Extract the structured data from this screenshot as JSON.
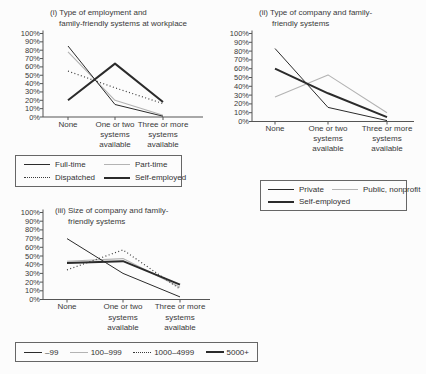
{
  "figure": {
    "background": "#fcfcfc",
    "text_color": "#333333",
    "axis_color": "#555555",
    "line_black": "#2b2b2b",
    "line_gray": "#b3b3b3"
  },
  "chart_data": [
    {
      "type": "line",
      "title_lines": [
        "(i) Type of employment and",
        "family-friendly systems at workplace"
      ],
      "categories": [
        "None",
        "One or two systems available",
        "Three or more systems available"
      ],
      "category_label_lines": [
        [
          "None"
        ],
        [
          "One or two",
          "systems",
          "available"
        ],
        [
          "Three or more",
          "systems",
          "available"
        ]
      ],
      "y_ticks": [
        "100%",
        "90%",
        "80%",
        "70%",
        "60%",
        "50%",
        "40%",
        "30%",
        "20%",
        "10%",
        "0%"
      ],
      "ylim": [
        0,
        100
      ],
      "grid": false,
      "series": [
        {
          "name": "Part-time",
          "values": [
            78,
            20,
            2
          ],
          "color": "#b3b3b3",
          "width": 1.1,
          "dash": ""
        },
        {
          "name": "Dispatched",
          "values": [
            55,
            35,
            16
          ],
          "color": "#3a3a3a",
          "width": 1.2,
          "dash": "1,2.4"
        },
        {
          "name": "Full-time",
          "values": [
            85,
            15,
            1
          ],
          "color": "#2b2b2b",
          "width": 1,
          "dash": ""
        },
        {
          "name": "Self-employed",
          "values": [
            20,
            64,
            18
          ],
          "color": "#2b2b2b",
          "width": 2,
          "dash": ""
        }
      ]
    },
    {
      "type": "line",
      "title_lines": [
        "(ii) Type of company and family-",
        "friendly systems"
      ],
      "categories": [
        "None",
        "One or two systems available",
        "Three or more systems available"
      ],
      "category_label_lines": [
        [
          "None"
        ],
        [
          "One or two",
          "systems",
          "available"
        ],
        [
          "Three or more",
          "systems",
          "available"
        ]
      ],
      "y_ticks": [
        "100%",
        "90%",
        "80%",
        "70%",
        "60%",
        "50%",
        "40%",
        "30%",
        "20%",
        "10%",
        "0%"
      ],
      "ylim": [
        0,
        100
      ],
      "grid": false,
      "series": [
        {
          "name": "Public, nonprofit",
          "values": [
            28,
            53,
            10
          ],
          "color": "#b3b3b3",
          "width": 1.1,
          "dash": ""
        },
        {
          "name": "Private",
          "values": [
            83,
            16,
            1
          ],
          "color": "#2b2b2b",
          "width": 1,
          "dash": ""
        },
        {
          "name": "Self-employed",
          "values": [
            60,
            32,
            5
          ],
          "color": "#2b2b2b",
          "width": 2,
          "dash": ""
        }
      ]
    },
    {
      "type": "line",
      "title_lines": [
        "(iii) Size of company and family-",
        "friendly systems"
      ],
      "categories": [
        "None",
        "One or two systems available",
        "Three or more systems available"
      ],
      "category_label_lines": [
        [
          "None"
        ],
        [
          "One or two",
          "systems",
          "available"
        ],
        [
          "Three or more",
          "systems",
          "available"
        ]
      ],
      "y_ticks": [
        "100%",
        "90%",
        "80%",
        "70%",
        "60%",
        "50%",
        "40%",
        "30%",
        "20%",
        "10%",
        "0%"
      ],
      "ylim": [
        0,
        100
      ],
      "grid": false,
      "series": [
        {
          "name": "100–999",
          "values": [
            44,
            47,
            14
          ],
          "color": "#b3b3b3",
          "width": 1.1,
          "dash": ""
        },
        {
          "name": "1000–4999",
          "values": [
            34,
            57,
            12
          ],
          "color": "#3a3a3a",
          "width": 1.2,
          "dash": "1,2.4"
        },
        {
          "name": "–99",
          "values": [
            70,
            30,
            3
          ],
          "color": "#2b2b2b",
          "width": 1,
          "dash": ""
        },
        {
          "name": "5000+",
          "values": [
            42,
            44,
            17
          ],
          "color": "#2b2b2b",
          "width": 2,
          "dash": ""
        }
      ]
    }
  ],
  "legends": [
    {
      "name": "employment-legend",
      "entries": [
        {
          "label": "Full-time",
          "style": "thin"
        },
        {
          "label": "Part-time",
          "style": "gray"
        },
        {
          "label": "Dispatched",
          "style": "dotted"
        },
        {
          "label": "Self-employed",
          "style": "thick"
        }
      ]
    },
    {
      "name": "company-type-legend",
      "entries": [
        {
          "label": "Private",
          "style": "thin"
        },
        {
          "label": "Public, nonprofit",
          "style": "gray"
        },
        {
          "label": "Self-employed",
          "style": "thick"
        }
      ]
    },
    {
      "name": "company-size-legend",
      "entries": [
        {
          "label": "–99",
          "style": "thin"
        },
        {
          "label": "100–999",
          "style": "gray"
        },
        {
          "label": "1000–4999",
          "style": "dotted"
        },
        {
          "label": "5000+",
          "style": "thick"
        }
      ]
    }
  ]
}
